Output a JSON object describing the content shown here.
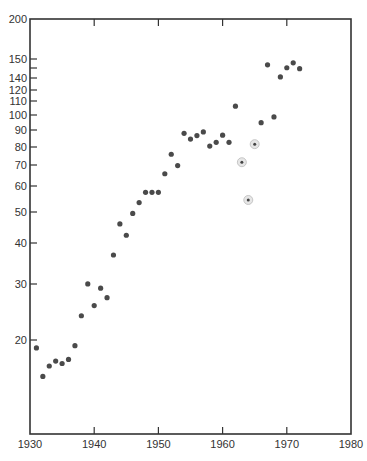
{
  "chart_data": {
    "type": "scatter",
    "title": "",
    "xlabel": "",
    "ylabel": "",
    "xlim": [
      1930,
      1980
    ],
    "ylim": [
      10,
      200
    ],
    "yscale": "log",
    "grid": false,
    "legend": null,
    "x_ticks": [
      {
        "label": "1930",
        "value": 1930
      },
      {
        "label": "1940",
        "value": 1940
      },
      {
        "label": "1950",
        "value": 1950
      },
      {
        "label": "1960",
        "value": 1960
      },
      {
        "label": "1970",
        "value": 1970
      },
      {
        "label": "1980",
        "value": 1980
      }
    ],
    "y_ticks": [
      {
        "label": "200",
        "py": 19
      },
      {
        "label": "150",
        "py": 59
      },
      {
        "label": "",
        "py": 68
      },
      {
        "label": "140",
        "py": 78
      },
      {
        "label": "120",
        "py": 90
      },
      {
        "label": "110",
        "py": 101
      },
      {
        "label": "100",
        "py": 115
      },
      {
        "label": "90",
        "py": 130
      },
      {
        "label": "80",
        "py": 147
      },
      {
        "label": "70",
        "py": 165
      },
      {
        "label": "60",
        "py": 186
      },
      {
        "label": "50",
        "py": 212
      },
      {
        "label": "40",
        "py": 243
      },
      {
        "label": "30",
        "py": 284
      },
      {
        "label": "20",
        "py": 340
      }
    ],
    "series": [
      {
        "name": "data",
        "points": [
          {
            "x": 1931,
            "y": 18.9
          },
          {
            "x": 1932,
            "y": 15.4
          },
          {
            "x": 1933,
            "y": 16.6
          },
          {
            "x": 1934,
            "y": 17.2
          },
          {
            "x": 1935,
            "y": 16.9
          },
          {
            "x": 1936,
            "y": 17.4
          },
          {
            "x": 1937,
            "y": 19.2
          },
          {
            "x": 1938,
            "y": 23.8
          },
          {
            "x": 1939,
            "y": 29.9
          },
          {
            "x": 1940,
            "y": 25.6
          },
          {
            "x": 1941,
            "y": 29.0
          },
          {
            "x": 1942,
            "y": 27.1
          },
          {
            "x": 1943,
            "y": 36.8
          },
          {
            "x": 1944,
            "y": 46.0
          },
          {
            "x": 1945,
            "y": 42.4
          },
          {
            "x": 1946,
            "y": 49.6
          },
          {
            "x": 1947,
            "y": 53.6
          },
          {
            "x": 1948,
            "y": 57.7
          },
          {
            "x": 1949,
            "y": 57.7
          },
          {
            "x": 1950,
            "y": 57.7
          },
          {
            "x": 1951,
            "y": 65.9
          },
          {
            "x": 1952,
            "y": 75.8
          },
          {
            "x": 1953,
            "y": 69.9
          },
          {
            "x": 1954,
            "y": 88.1
          },
          {
            "x": 1955,
            "y": 84.5
          },
          {
            "x": 1956,
            "y": 86.7
          },
          {
            "x": 1957,
            "y": 89.0
          },
          {
            "x": 1958,
            "y": 80.4
          },
          {
            "x": 1959,
            "y": 82.6
          },
          {
            "x": 1960,
            "y": 86.9
          },
          {
            "x": 1961,
            "y": 82.6
          },
          {
            "x": 1962,
            "y": 107.0
          },
          {
            "x": 1966,
            "y": 95.1
          },
          {
            "x": 1967,
            "y": 144.0
          },
          {
            "x": 1968,
            "y": 99.1
          },
          {
            "x": 1969,
            "y": 132.0
          },
          {
            "x": 1970,
            "y": 141.0
          },
          {
            "x": 1971,
            "y": 146.0
          },
          {
            "x": 1972,
            "y": 140.0
          }
        ]
      },
      {
        "name": "circled",
        "points": [
          {
            "x": 1963,
            "y": 71.6
          },
          {
            "x": 1964,
            "y": 54.6
          },
          {
            "x": 1965,
            "y": 81.5
          }
        ]
      }
    ]
  }
}
